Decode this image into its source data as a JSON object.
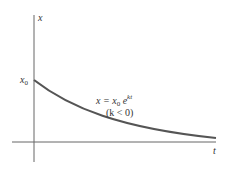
{
  "diagram": {
    "y_axis_label": "x",
    "x_axis_label": "t",
    "initial_value_label": "x",
    "initial_value_subscript": "0",
    "formula": {
      "lhs": "x = x",
      "sub": "0",
      "base": " e",
      "exponent": "kt"
    },
    "condition": "(k < 0)",
    "colors": {
      "axis": "#666666",
      "curve": "#555555",
      "text": "#333333"
    }
  }
}
